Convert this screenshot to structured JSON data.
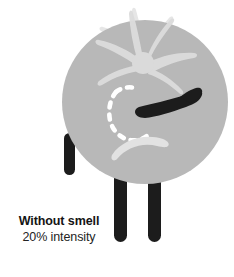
{
  "canvas": {
    "width": 234,
    "height": 277,
    "background": "#ffffff"
  },
  "text_block": {
    "heading": "tion",
    "lines": [
      "ense of",
      "would",
      "ercent",
      "ome."
    ],
    "note": "text is clipped at the left edge of the screenshot"
  },
  "caption": {
    "title": "Without smell",
    "subtitle": "20% intensity"
  },
  "figure": {
    "name": "sad-tomato-character",
    "body_color": "#b8b8b8",
    "leaf_color": "#e4e4e4",
    "limb_color": "#1c1c1c",
    "eye_dashed_color": "#ffffff",
    "eye_closed_color": "#1c1c1c",
    "mouth_color": "#e2e2e2",
    "parts": [
      "leaves",
      "body",
      "dashed-eye",
      "closed-eye",
      "frown-mouth",
      "left-arm",
      "left-leg",
      "right-leg"
    ]
  }
}
